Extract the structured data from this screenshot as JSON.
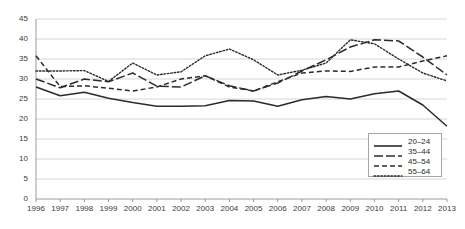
{
  "chart_data": {
    "type": "line",
    "title": "",
    "subtitle": "",
    "xlabel": "",
    "ylabel": "",
    "grid": true,
    "legend_position": "bottom-right",
    "xlim": [
      1996,
      2013
    ],
    "ylim": [
      0,
      45
    ],
    "ytick_step": 5,
    "x": [
      1996,
      1997,
      1998,
      1999,
      2000,
      2001,
      2002,
      2003,
      2004,
      2005,
      2006,
      2007,
      2008,
      2009,
      2010,
      2011,
      2012,
      2013
    ],
    "categories": [
      "1996",
      "1997",
      "1998",
      "1999",
      "2000",
      "2001",
      "2002",
      "2003",
      "2004",
      "2005",
      "2006",
      "2007",
      "2008",
      "2009",
      "2010",
      "2011",
      "2012",
      "2013"
    ],
    "yticks": [
      "0",
      "5",
      "10",
      "15",
      "20",
      "25",
      "30",
      "35",
      "40",
      "45"
    ],
    "series": [
      {
        "name": "20-24",
        "dash": "solid",
        "color": "#2b2b2b",
        "values": [
          28.0,
          25.8,
          26.7,
          25.2,
          24.1,
          23.2,
          23.2,
          23.3,
          24.6,
          24.5,
          23.2,
          24.8,
          25.6,
          25.0,
          26.3,
          27.0,
          23.5,
          18.2
        ]
      },
      {
        "name": "35-44",
        "dash": "longdash",
        "color": "#2b2b2b",
        "values": [
          30.0,
          27.8,
          30.0,
          29.3,
          31.5,
          28.2,
          28.0,
          30.8,
          28.3,
          27.0,
          29.0,
          32.0,
          34.8,
          38.0,
          39.8,
          39.5,
          35.5,
          31.0
        ]
      },
      {
        "name": "45-54",
        "dash": "dashed",
        "color": "#2b2b2b",
        "values": [
          35.8,
          28.1,
          28.3,
          27.7,
          27.0,
          28.0,
          30.0,
          30.8,
          28.0,
          27.0,
          29.3,
          31.5,
          32.0,
          31.9,
          33.0,
          33.0,
          34.5,
          35.8
        ]
      },
      {
        "name": "55-64",
        "dash": "dotted",
        "color": "#2b2b2b",
        "values": [
          32.0,
          32.0,
          32.1,
          29.4,
          34.0,
          31.0,
          31.8,
          35.8,
          37.5,
          34.8,
          31.0,
          32.2,
          34.0,
          39.8,
          38.8,
          35.0,
          31.5,
          29.5
        ]
      }
    ]
  },
  "legend": {
    "items": [
      {
        "label": "20–24",
        "dash": "solid"
      },
      {
        "label": "35–44",
        "dash": "longdash"
      },
      {
        "label": "45–54",
        "dash": "dashed"
      },
      {
        "label": "55–64",
        "dash": "dotted"
      }
    ]
  }
}
